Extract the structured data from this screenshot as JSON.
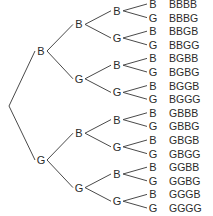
{
  "diagram": {
    "type": "probability-tree",
    "levels": 4,
    "outcomes": [
      "B",
      "G"
    ],
    "level1": [
      "B",
      "G"
    ],
    "level2": [
      "B",
      "G",
      "B",
      "G"
    ],
    "level3": [
      "B",
      "G",
      "B",
      "G",
      "B",
      "G",
      "B",
      "G"
    ],
    "leaves": [
      "B",
      "G",
      "B",
      "G",
      "B",
      "G",
      "B",
      "G",
      "B",
      "G",
      "B",
      "G",
      "B",
      "G",
      "B",
      "G"
    ],
    "sequences": [
      "BBBB",
      "BBBG",
      "BBGB",
      "BBGG",
      "BGBB",
      "BGBG",
      "BGGB",
      "BGGG",
      "GBBB",
      "GBBG",
      "GBGB",
      "GBGG",
      "GGBB",
      "GGBG",
      "GGGB",
      "GGGG"
    ]
  }
}
